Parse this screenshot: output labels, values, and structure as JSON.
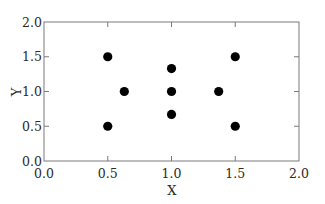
{
  "chart_data": {
    "type": "scatter",
    "title": "",
    "xlabel": "X",
    "ylabel": "Y",
    "xlim": [
      0.0,
      2.0
    ],
    "ylim": [
      0.0,
      2.0
    ],
    "grid": false,
    "legend": null,
    "xticks": [
      "0.0",
      "0.5",
      "1.0",
      "1.5",
      "2.0"
    ],
    "yticks": [
      "0.0",
      "0.5",
      "1.0",
      "1.5",
      "2.0"
    ],
    "series": [
      {
        "name": "points",
        "color": "#000000",
        "marker": "circle",
        "points": [
          {
            "x": 0.5,
            "y": 1.5
          },
          {
            "x": 1.5,
            "y": 1.5
          },
          {
            "x": 1.0,
            "y": 1.33
          },
          {
            "x": 0.63,
            "y": 1.0
          },
          {
            "x": 1.0,
            "y": 1.0
          },
          {
            "x": 1.37,
            "y": 1.0
          },
          {
            "x": 1.0,
            "y": 0.67
          },
          {
            "x": 0.5,
            "y": 0.5
          },
          {
            "x": 1.5,
            "y": 0.5
          }
        ]
      }
    ]
  }
}
